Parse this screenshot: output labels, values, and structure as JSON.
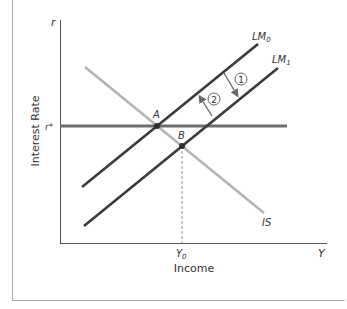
{
  "diagram": {
    "title": "",
    "axes": {
      "y_symbol": "r",
      "y_label": "Interest Rate",
      "x_symbol": "Y",
      "x_label": "Income",
      "r_star_label": "r*",
      "y0_label": "Y",
      "y0_sub": "0"
    },
    "curves": [
      {
        "id": "LM0",
        "label": "LM",
        "sub": "0",
        "color": "#3a3a3a"
      },
      {
        "id": "LM1",
        "label": "LM",
        "sub": "1",
        "color": "#3a3a3a"
      },
      {
        "id": "IS",
        "label": "IS",
        "color": "#b4b4b4"
      },
      {
        "id": "rstar",
        "label": "r*",
        "color": "#6e6e6e"
      }
    ],
    "points": [
      {
        "id": "A",
        "label": "A"
      },
      {
        "id": "B",
        "label": "B"
      }
    ],
    "steps": [
      {
        "id": "step1",
        "label": "1",
        "direction": "LM0 to LM1 (shift down/right)"
      },
      {
        "id": "step2",
        "label": "2",
        "direction": "LM1 back to LM0 (shift up/left)"
      }
    ],
    "colors": {
      "axis": "#555555",
      "lm": "#3a3a3a",
      "is": "#b4b4b4",
      "rstar": "#6e6e6e",
      "arrow": "#6a6a6a",
      "border": "#aaaaaa"
    }
  }
}
